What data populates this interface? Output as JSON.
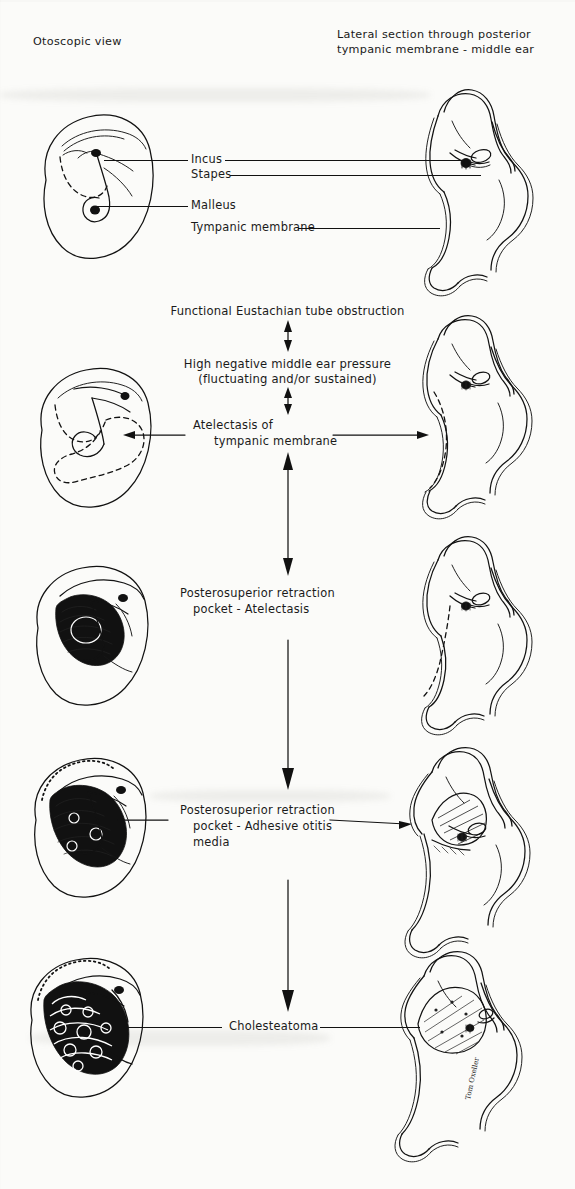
{
  "figure": {
    "title_left": "Otoscopic view",
    "title_right_line1": "Lateral section through posterior",
    "title_right_line2": "tympanic membrane - middle ear"
  },
  "anatomy_labels": [
    {
      "name": "incus",
      "text": "Incus"
    },
    {
      "name": "stapes",
      "text": "Stapes"
    },
    {
      "name": "malleus",
      "text": "Malleus"
    },
    {
      "name": "tympanic-membrane",
      "text": "Tympanic membrane"
    }
  ],
  "stages": [
    {
      "id": "normal",
      "caption_lines": []
    },
    {
      "id": "eustachian-obstruction",
      "caption_lines": [
        "Functional Eustachian tube obstruction"
      ]
    },
    {
      "id": "negative-pressure",
      "caption_lines": [
        "High negative middle ear pressure",
        "(fluctuating and/or sustained)"
      ]
    },
    {
      "id": "atelectasis",
      "caption_lines": [
        "Atelectasis of",
        "tympanic membrane"
      ]
    },
    {
      "id": "retraction-pocket-atelectasis",
      "caption_lines": [
        "Posterosuperior retraction",
        "pocket - Atelectasis"
      ]
    },
    {
      "id": "adhesive-otitis-media",
      "caption_lines": [
        "Posterosuperior retraction",
        "pocket - Adhesive otitis",
        "media"
      ]
    },
    {
      "id": "cholesteatoma",
      "caption_lines": [
        "Cholesteatoma"
      ]
    }
  ],
  "signature": "Tom Oxeller",
  "colors": {
    "ink": "#121212",
    "paper": "#fbfbf9"
  }
}
